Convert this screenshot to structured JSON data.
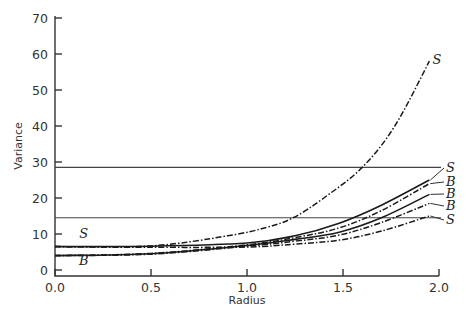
{
  "chart_data": {
    "type": "line",
    "title": "",
    "xlabel": "Radius",
    "ylabel": "Variance",
    "xlim": [
      0.0,
      2.0
    ],
    "ylim": [
      0,
      70
    ],
    "x_ticks": [
      "0.0",
      "0.5",
      "1.0",
      "1.5",
      "2.0"
    ],
    "y_ticks": [
      "0",
      "10",
      "20",
      "30",
      "40",
      "50",
      "60",
      "70"
    ],
    "grid": false,
    "legend": "inline labels at right end of curves",
    "reference_lines": [
      {
        "name": "upper-horizontal",
        "y": 28.5
      },
      {
        "name": "lower-horizontal",
        "y": 14.5
      }
    ],
    "start_labels": [
      {
        "label": "S",
        "x": 0.15,
        "y": 8.8
      },
      {
        "label": "B",
        "x": 0.15,
        "y": 1.3
      }
    ],
    "series": [
      {
        "name": "S",
        "style": "dash-dot",
        "end_label": "S",
        "x": [
          0.0,
          0.5,
          0.9,
          1.1,
          1.24,
          1.4,
          1.6,
          1.77,
          1.95
        ],
        "values": [
          6.5,
          6.7,
          9.5,
          11.8,
          14.5,
          20,
          28.5,
          40,
          58
        ]
      },
      {
        "name": "S",
        "style": "solid",
        "end_label": "S",
        "x": [
          0.0,
          0.5,
          1.0,
          1.25,
          1.48,
          1.7,
          1.95
        ],
        "values": [
          6.5,
          6.6,
          7.5,
          9.5,
          13,
          18,
          25
        ]
      },
      {
        "name": "B",
        "style": "dash-dot",
        "end_label": "B",
        "x": [
          0.0,
          0.5,
          1.0,
          1.25,
          1.48,
          1.7,
          1.95
        ],
        "values": [
          4,
          4.6,
          7,
          9,
          11.7,
          16.5,
          24
        ]
      },
      {
        "name": "B",
        "style": "solid",
        "end_label": "B",
        "x": [
          0.0,
          0.5,
          1.0,
          1.25,
          1.48,
          1.7,
          1.95
        ],
        "values": [
          4,
          4.5,
          6.8,
          8.5,
          10.5,
          14.5,
          21
        ]
      },
      {
        "name": "B",
        "style": "dash-dot",
        "end_label": "B",
        "x": [
          0.0,
          0.5,
          1.0,
          1.25,
          1.48,
          1.7,
          1.95
        ],
        "values": [
          4,
          4.4,
          6.6,
          8,
          9.7,
          13.2,
          18.5
        ]
      },
      {
        "name": "S",
        "style": "dash-dot",
        "end_label": "S",
        "x": [
          0.0,
          0.5,
          1.0,
          1.25,
          1.48,
          1.7,
          1.95
        ],
        "values": [
          6.5,
          6.3,
          6.4,
          7.2,
          8.3,
          10.8,
          15
        ]
      }
    ]
  }
}
